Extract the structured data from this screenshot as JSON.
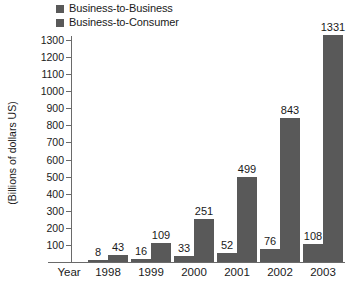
{
  "legend": {
    "items": [
      {
        "label": "Business-to-Business",
        "color": "#595959",
        "icon": "legend-swatch-icon"
      },
      {
        "label": "Business-to-Consumer",
        "color": "#595959",
        "icon": "legend-swatch-icon"
      }
    ]
  },
  "axes": {
    "x_axis_name": "Year",
    "y_title": "(Billions of dollars US)",
    "y_ticks": [
      "1300",
      "1200",
      "1100",
      "1000",
      "900",
      "800",
      "700",
      "600",
      "500",
      "400",
      "300",
      "200",
      "100"
    ]
  },
  "chart_data": {
    "type": "bar",
    "title": "",
    "subtitle": "",
    "xlabel": "Year",
    "ylabel": "(Billions of dollars US)",
    "categories": [
      "1998",
      "1999",
      "2000",
      "2001",
      "2002",
      "2003"
    ],
    "series": [
      {
        "name": "Business-to-Business",
        "color": "#595959",
        "values": [
          8,
          16,
          33,
          52,
          76,
          108
        ]
      },
      {
        "name": "Business-to-Consumer",
        "color": "#595959",
        "values": [
          43,
          109,
          251,
          499,
          843,
          1331
        ]
      }
    ],
    "value_labels": [
      [
        "8",
        "43"
      ],
      [
        "16",
        "109"
      ],
      [
        "33",
        "251"
      ],
      [
        "52",
        "499"
      ],
      [
        "76",
        "843"
      ],
      [
        "108",
        "1331"
      ]
    ],
    "ylim": [
      0,
      1400
    ],
    "ytick_values": [
      1300,
      1200,
      1100,
      1000,
      900,
      800,
      700,
      600,
      500,
      400,
      300,
      200,
      100
    ],
    "grid": false,
    "legend_position": "top-left",
    "axis_color": "#6a6a6a",
    "background": "#ffffff"
  }
}
